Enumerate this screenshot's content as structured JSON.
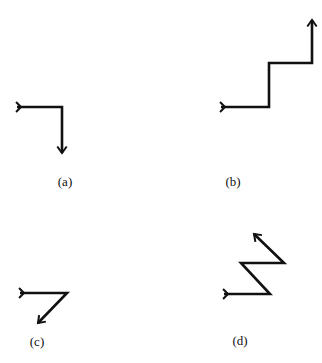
{
  "diagram": {
    "stroke_color": "#111111",
    "background": "#ffffff",
    "panels": [
      {
        "id": "a",
        "label": "(a)",
        "label_pos": [
          65,
          182
        ],
        "path": [
          [
            17,
            107
          ],
          [
            62,
            107
          ],
          [
            62,
            153
          ]
        ],
        "description": "right then down"
      },
      {
        "id": "b",
        "label": "(b)",
        "label_pos": [
          233,
          182
        ],
        "path": [
          [
            221,
            107
          ],
          [
            269,
            107
          ],
          [
            269,
            63
          ],
          [
            312,
            63
          ],
          [
            312,
            20
          ]
        ],
        "description": "staircase right-up-right-up"
      },
      {
        "id": "c",
        "label": "(c)",
        "label_pos": [
          37,
          342
        ],
        "path": [
          [
            20,
            293
          ],
          [
            67,
            293
          ],
          [
            38,
            323
          ]
        ],
        "description": "right then diagonal down-left"
      },
      {
        "id": "d",
        "label": "(d)",
        "label_pos": [
          240,
          341
        ],
        "path": [
          [
            224,
            294
          ],
          [
            270,
            294
          ],
          [
            241,
            263
          ],
          [
            284,
            263
          ],
          [
            254,
            234
          ]
        ],
        "description": "zigzag right, up-left, right, up-left"
      }
    ]
  }
}
